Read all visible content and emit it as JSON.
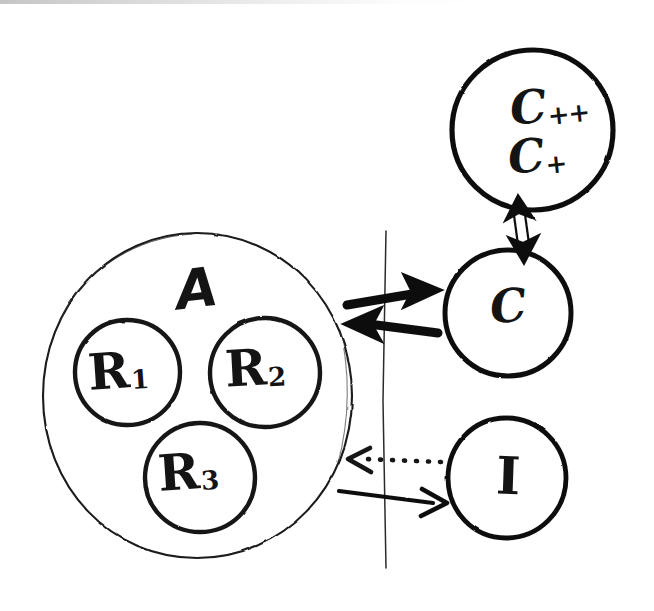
{
  "diagram": {
    "style": "hand-drawn ink sketch on white paper",
    "ink_color": "#141414",
    "paper_color": "#ffffff",
    "nodes": [
      {
        "id": "A",
        "label": "A",
        "shape": "circle",
        "stroke": "thin",
        "role": "outer-group",
        "contains": [
          "R1",
          "R2",
          "R3"
        ],
        "center": [
          197,
          395
        ],
        "radius": 155
      },
      {
        "id": "R1",
        "label": "R",
        "subscript": "1",
        "shape": "circle",
        "stroke": "medium",
        "center": [
          127,
          372
        ],
        "radius": 53
      },
      {
        "id": "R2",
        "label": "R",
        "subscript": "2",
        "shape": "circle",
        "stroke": "medium",
        "center": [
          265,
          372
        ],
        "radius": 55
      },
      {
        "id": "R3",
        "label": "R",
        "subscript": "3",
        "shape": "circle",
        "stroke": "medium",
        "center": [
          200,
          477
        ],
        "radius": 55
      },
      {
        "id": "Cplus",
        "label_lines": [
          "C++",
          "C+"
        ],
        "labels": [
          {
            "base": "C",
            "superscript": "++"
          },
          {
            "base": "C",
            "superscript": "+"
          }
        ],
        "shape": "circle",
        "stroke": "thick",
        "center": [
          533,
          130
        ],
        "radius": 81
      },
      {
        "id": "C",
        "label": "C",
        "shape": "circle",
        "stroke": "thick",
        "center": [
          508,
          313
        ],
        "radius": 63
      },
      {
        "id": "I",
        "label": "I",
        "shape": "circle",
        "stroke": "thick",
        "center": [
          506,
          478
        ],
        "radius": 60
      }
    ],
    "divider": {
      "name": "vertical-boundary-line",
      "orientation": "vertical",
      "x": 385,
      "y_start": 230,
      "y_end": 570,
      "stroke": "hairline"
    },
    "edges": [
      {
        "id": "A-to-C",
        "from": "A",
        "to": "C",
        "direction": "right",
        "style": "thick-solid",
        "arrowheads": "single",
        "crosses_divider": true
      },
      {
        "id": "C-to-A",
        "from": "C",
        "to": "A",
        "direction": "left",
        "style": "thick-solid",
        "arrowheads": "single",
        "crosses_divider": true
      },
      {
        "id": "C-to-Cplus",
        "from": "C",
        "to": "Cplus",
        "direction": "bidirectional-vertical",
        "style": "open-double-line",
        "arrowheads": "double",
        "crosses_divider": false
      },
      {
        "id": "I-to-A",
        "from": "I",
        "to": "A",
        "direction": "left",
        "style": "dotted",
        "arrowheads": "single",
        "crosses_divider": true
      },
      {
        "id": "A-to-I",
        "from": "A",
        "to": "I",
        "direction": "right",
        "style": "thin-solid",
        "arrowheads": "single",
        "crosses_divider": true
      }
    ]
  },
  "labels": {
    "A": "A",
    "R1_base": "R",
    "R1_sub": "1",
    "R2_base": "R",
    "R2_sub": "2",
    "R3_base": "R",
    "R3_sub": "3",
    "Cpp_base": "C",
    "Cpp_sup": "++",
    "Cp_base": "C",
    "Cp_sup": "+",
    "C": "C",
    "I": "I"
  }
}
